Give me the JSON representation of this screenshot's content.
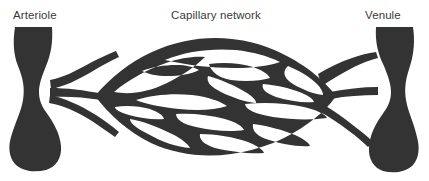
{
  "figure": {
    "background_color": "#ffffff",
    "vessel_color": "#333333",
    "label_color": "#3a3a3a",
    "width": 429,
    "height": 181
  },
  "labels": {
    "arteriole": "Arteriole",
    "capillary_network": "Capillary network",
    "venule": "Venule"
  },
  "structures": {
    "arteriole_name": "arteriole-vessel",
    "venule_name": "venule-vessel",
    "network_name": "capillary-network-mesh"
  }
}
